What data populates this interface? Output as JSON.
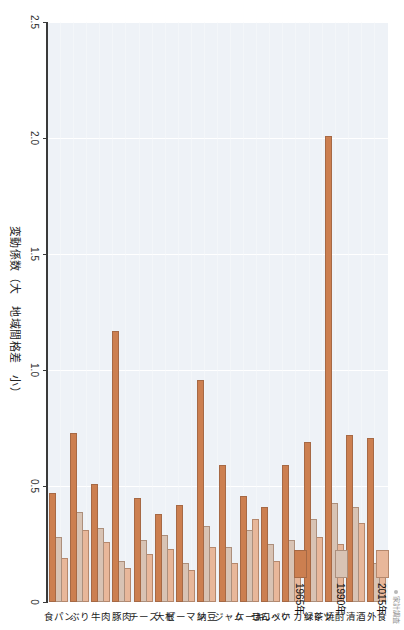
{
  "chart_data": {
    "type": "bar",
    "orientation": "horizontal",
    "title": "",
    "xlabel": "変動係数（大　地域間格差　小）",
    "ylabel": "",
    "xlim": [
      0,
      2.5
    ],
    "xticks": [
      "0",
      "0.5",
      "1.0",
      "1.5",
      "2.0",
      "2.5"
    ],
    "xtick_values": [
      0,
      0.5,
      1.0,
      1.5,
      2.0,
      2.5
    ],
    "grid": true,
    "legend_position": "right",
    "categories": [
      "食パン",
      "ぶり",
      "牛肉",
      "豚肉",
      "チーズ",
      "大根",
      "ピーマン",
      "納豆",
      "ジャム",
      "ケーキ",
      "せんべい",
      "コロッケ カツレツ",
      "緑茶",
      "焼酎",
      "清酒",
      "外食"
    ],
    "series": [
      {
        "name": "2015年",
        "color": "#e8b79a",
        "values": [
          0.18,
          0.3,
          0.25,
          0.14,
          0.2,
          0.22,
          0.13,
          0.23,
          0.16,
          0.35,
          0.17,
          0.19,
          0.27,
          0.24,
          0.33,
          0.18
        ]
      },
      {
        "name": "1990年",
        "color": "#d8c3b4",
        "values": [
          0.27,
          0.38,
          0.31,
          0.17,
          0.26,
          0.28,
          0.16,
          0.32,
          0.23,
          0.3,
          0.24,
          0.26,
          0.35,
          0.42,
          0.4,
          0.16
        ]
      },
      {
        "name": "1965年",
        "color": "#cc7f50",
        "values": [
          0.46,
          0.72,
          0.5,
          1.16,
          0.44,
          0.37,
          0.41,
          0.95,
          0.58,
          0.45,
          0.4,
          0.58,
          0.68,
          2.0,
          0.71,
          0.7
        ]
      }
    ]
  },
  "axis": {
    "title": "変動係数（大　地域間格差　小）",
    "ticks": [
      "0",
      "0.5",
      "1.0",
      "1.5",
      "2.0",
      "2.5"
    ]
  },
  "legend": {
    "items": [
      {
        "label": "2015年",
        "color": "#e8b79a"
      },
      {
        "label": "1990年",
        "color": "#d8c3b4"
      },
      {
        "label": "1965年",
        "color": "#cc7f50"
      }
    ]
  },
  "source": {
    "text": "家計調査"
  }
}
